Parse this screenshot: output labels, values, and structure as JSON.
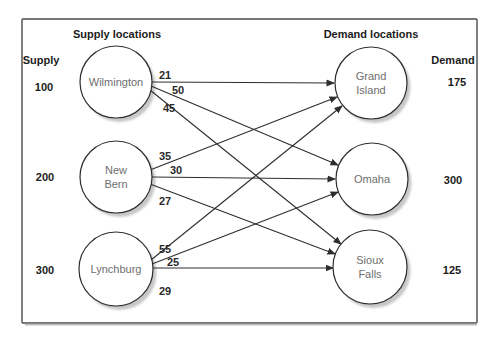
{
  "diagram": {
    "type": "transportation-network",
    "supply_column": {
      "header": "Supply locations",
      "axis_label": "Supply",
      "nodes": [
        {
          "name": "Wilmington",
          "supply": "100",
          "lines": [
            "Wilmington"
          ]
        },
        {
          "name": "New Bern",
          "supply": "200",
          "lines": [
            "New",
            "Bern"
          ]
        },
        {
          "name": "Lynchburg",
          "supply": "300",
          "lines": [
            "Lynchburg"
          ]
        }
      ]
    },
    "demand_column": {
      "header": "Demand locations",
      "axis_label": "Demand",
      "nodes": [
        {
          "name": "Grand Island",
          "demand": "175",
          "lines": [
            "Grand",
            "Island"
          ]
        },
        {
          "name": "Omaha",
          "demand": "300",
          "lines": [
            "Omaha"
          ]
        },
        {
          "name": "Sioux Falls",
          "demand": "125",
          "lines": [
            "Sioux",
            "Falls"
          ]
        }
      ]
    },
    "edges": [
      {
        "from": "Wilmington",
        "to": "Grand Island",
        "cost": "21"
      },
      {
        "from": "Wilmington",
        "to": "Omaha",
        "cost": "50"
      },
      {
        "from": "Wilmington",
        "to": "Sioux Falls",
        "cost": "45"
      },
      {
        "from": "New Bern",
        "to": "Grand Island",
        "cost": "35"
      },
      {
        "from": "New Bern",
        "to": "Omaha",
        "cost": "30"
      },
      {
        "from": "New Bern",
        "to": "Sioux Falls",
        "cost": "27"
      },
      {
        "from": "Lynchburg",
        "to": "Grand Island",
        "cost": "55"
      },
      {
        "from": "Lynchburg",
        "to": "Omaha",
        "cost": "25"
      },
      {
        "from": "Lynchburg",
        "to": "Sioux Falls",
        "cost": "29"
      }
    ],
    "colors": {
      "line": "#2e2e2e",
      "frame_border": "#4a4a4a",
      "node_text": "#6e6e6e",
      "text": "#1c1c1c",
      "node_shadow": "#c7c7c7",
      "background": "#ffffff"
    }
  }
}
